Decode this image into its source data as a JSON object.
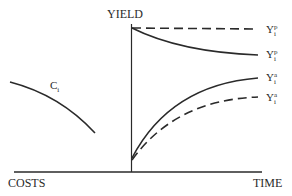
{
  "diagram": {
    "axes": {
      "vertical_label": "YIELD",
      "horizontal_right_label": "TIME",
      "horizontal_left_label": "COSTS"
    },
    "curves": [
      {
        "id": "cost-curve",
        "label": "C",
        "subscript": "i",
        "superscript": "",
        "style": "solid",
        "description": "declining cost curve on left"
      },
      {
        "id": "yield-potential-dashed",
        "label": "Y",
        "subscript": "i",
        "superscript": "p",
        "style": "dashed",
        "description": "flat potential yield"
      },
      {
        "id": "yield-potential-solid",
        "label": "Y",
        "subscript": "i",
        "superscript": "p",
        "style": "solid",
        "description": "declining potential yield"
      },
      {
        "id": "yield-actual-solid",
        "label": "Y",
        "subscript": "i",
        "superscript": "a",
        "style": "solid",
        "description": "rising actual yield"
      },
      {
        "id": "yield-actual-dashed",
        "label": "Y",
        "subscript": "i",
        "superscript": "a",
        "style": "dashed",
        "description": "rising actual yield (lower)"
      }
    ],
    "colors": {
      "line": "#2a2a2a",
      "background": "#ffffff"
    }
  }
}
